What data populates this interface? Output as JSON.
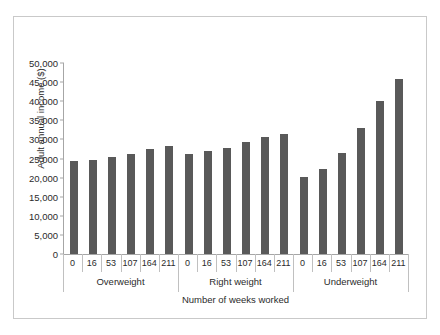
{
  "chart_data": {
    "type": "bar",
    "title": "",
    "xlabel": "Number of weeks worked",
    "ylabel": "Adult annual income ($)",
    "ylim": [
      0,
      50000
    ],
    "ytick_labels": [
      "0",
      "5,000",
      "10,000",
      "15,000",
      "20,000",
      "25,000",
      "30,000",
      "35,000",
      "40,000",
      "45,000",
      "50,000"
    ],
    "ytick_values": [
      0,
      5000,
      10000,
      15000,
      20000,
      25000,
      30000,
      35000,
      40000,
      45000,
      50000
    ],
    "categories": [
      "0",
      "16",
      "53",
      "107",
      "164",
      "211"
    ],
    "groups": [
      "Overweight",
      "Right weight",
      "Underweight"
    ],
    "grid": false,
    "legend": "none",
    "bar_color": "#595959",
    "axis_color": "#a6a6a6",
    "frame_color": "#c9c9c9",
    "series": [
      {
        "name": "Overweight",
        "values": [
          24300,
          24700,
          25400,
          26300,
          27400,
          28400
        ]
      },
      {
        "name": "Right weight",
        "values": [
          26300,
          26900,
          27800,
          29300,
          30700,
          31500
        ]
      },
      {
        "name": "Underweight",
        "values": [
          20100,
          22200,
          26500,
          33100,
          40000,
          45800
        ]
      }
    ]
  }
}
